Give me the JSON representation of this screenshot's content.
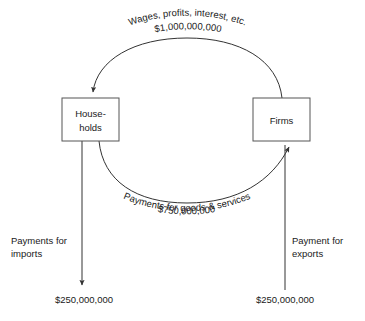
{
  "diagram": {
    "type": "circular-flow-of-income",
    "nodes": [
      {
        "id": "households",
        "label_line1": "House-",
        "label_line2": "holds"
      },
      {
        "id": "firms",
        "label_line1": "Firms",
        "label_line2": ""
      }
    ],
    "top_flow": {
      "description": "Wages, profits, interest, etc.",
      "amount": "$1,000,000,000",
      "direction": "firms-to-households"
    },
    "bottom_flow": {
      "amount": "$750,000,000",
      "description": "Payments for goods & services",
      "direction": "households-to-firms"
    },
    "imports_flow": {
      "label_line1": "Payments for",
      "label_line2": "imports",
      "amount": "$250,000,000",
      "direction": "out-of-households-downward"
    },
    "exports_flow": {
      "label_line1": "Payment for",
      "label_line2": "exports",
      "amount": "$250,000,000",
      "direction": "into-firms-upward"
    },
    "colors": {
      "background": "#ffffff",
      "stroke": "#333333",
      "box_stroke": "#555555",
      "text": "#1a1a1a"
    }
  }
}
